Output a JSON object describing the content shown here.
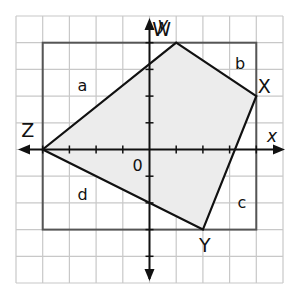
{
  "diagram": {
    "type": "coordinate-plane-polygon",
    "grid": {
      "xmin": -5,
      "xmax": 5,
      "ymin": -5,
      "ymax": 5,
      "step": 1
    },
    "axes": {
      "x_label": "x",
      "y_label": "y",
      "origin_label": "0"
    },
    "polygon": {
      "name": "WXYZ",
      "vertices": [
        {
          "label": "W",
          "x": 1,
          "y": 4
        },
        {
          "label": "X",
          "x": 4,
          "y": 2
        },
        {
          "label": "Y",
          "x": 2,
          "y": -3
        },
        {
          "label": "Z",
          "x": -4,
          "y": 0
        }
      ],
      "fill": "#ececec"
    },
    "rectangle": {
      "x1": -4,
      "y1": -3,
      "x2": 4,
      "y2": 4
    },
    "regions": [
      {
        "label": "a",
        "x": -2.7,
        "y": 2.2
      },
      {
        "label": "b",
        "x": 3.2,
        "y": 3.0
      },
      {
        "label": "c",
        "x": 3.3,
        "y": -2.2
      },
      {
        "label": "d",
        "x": -2.7,
        "y": -1.9
      }
    ],
    "colors": {
      "grid": "#c8c8c8",
      "rect": "#555555",
      "lines": "#111111"
    }
  }
}
